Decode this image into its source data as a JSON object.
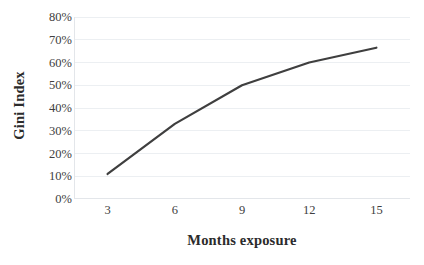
{
  "chart_data": {
    "type": "line",
    "title": "",
    "xlabel": "Months exposure",
    "ylabel": "Gini Index",
    "x": [
      3,
      6,
      9,
      12,
      15
    ],
    "values": [
      0.11,
      0.33,
      0.5,
      0.6,
      0.665
    ],
    "series": [
      {
        "name": "Gini Index",
        "values": [
          0.11,
          0.33,
          0.5,
          0.6,
          0.665
        ]
      }
    ],
    "x_tick_labels": [
      "3",
      "6",
      "9",
      "12",
      "15"
    ],
    "y_tick_labels": [
      "0%",
      "10%",
      "20%",
      "30%",
      "40%",
      "50%",
      "60%",
      "70%",
      "80%"
    ],
    "y_tick_values": [
      0,
      0.1,
      0.2,
      0.3,
      0.4,
      0.5,
      0.6,
      0.7,
      0.8
    ],
    "xlim": [
      1.5,
      16.5
    ],
    "ylim": [
      0,
      0.8
    ],
    "grid": "horizontal",
    "legend": "none",
    "line_color": "#3f3f3f",
    "gridline_color": "#eceff2",
    "axis_color": "#e3e6ea",
    "background_color": "#ffffff"
  }
}
